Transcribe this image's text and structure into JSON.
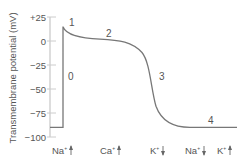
{
  "chart_data": {
    "type": "line",
    "title": "",
    "xlabel": "",
    "ylabel": "Transmembrane potential (mV)",
    "ylim": [
      -100,
      25
    ],
    "yticks": [
      {
        "value": 25,
        "label": "+25"
      },
      {
        "value": 0,
        "label": "0"
      },
      {
        "value": -25,
        "label": "−25"
      },
      {
        "value": -50,
        "label": "−50"
      },
      {
        "value": -75,
        "label": "−75"
      },
      {
        "value": -100,
        "label": "−100"
      }
    ],
    "grid": false,
    "series": [
      {
        "name": "Cardiac action potential",
        "color": "#777777",
        "points": [
          {
            "t": 0,
            "mV": -90
          },
          {
            "t": 13,
            "mV": -90
          },
          {
            "t": 13,
            "mV": 15
          },
          {
            "t": 20,
            "mV": 5
          },
          {
            "t": 40,
            "mV": 2
          },
          {
            "t": 70,
            "mV": 0
          },
          {
            "t": 90,
            "mV": -10
          },
          {
            "t": 100,
            "mV": -40
          },
          {
            "t": 110,
            "mV": -75
          },
          {
            "t": 125,
            "mV": -88
          },
          {
            "t": 140,
            "mV": -90
          },
          {
            "t": 187,
            "mV": -90
          }
        ]
      }
    ],
    "phase_labels": [
      {
        "label": "0",
        "x": 68,
        "y": 80
      },
      {
        "label": "1",
        "x": 69,
        "y": 26
      },
      {
        "label": "2",
        "x": 106,
        "y": 37
      },
      {
        "label": "3",
        "x": 159,
        "y": 80
      },
      {
        "label": "4",
        "x": 208,
        "y": 124
      }
    ],
    "ion_labels": [
      {
        "ion": "Na",
        "charge": "+",
        "direction": "up",
        "x": 52
      },
      {
        "ion": "Ca",
        "charge": "+",
        "direction": "up",
        "x": 100
      },
      {
        "ion": "K",
        "charge": "+",
        "direction": "down",
        "x": 150
      },
      {
        "ion": "Na",
        "charge": "+",
        "direction": "down",
        "x": 185
      },
      {
        "ion": "K",
        "charge": "+",
        "direction": "up",
        "x": 217
      }
    ]
  }
}
